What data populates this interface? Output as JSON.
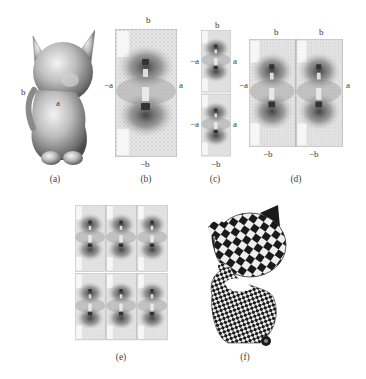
{
  "figure": {
    "panels": [
      {
        "id": "a",
        "caption": "(a)",
        "description": "3D kitten mesh, shaded",
        "seam_labels": [
          "b",
          "a"
        ]
      },
      {
        "id": "b",
        "caption": "(b)",
        "description": "parameterization cut open to a rectangle",
        "edge_labels": {
          "top": "b",
          "bottom": "−b",
          "left": "−a",
          "right": "a"
        }
      },
      {
        "id": "c",
        "caption": "(c)",
        "description": "two copies stacked vertically",
        "edge_labels": {
          "top": "b",
          "bottom": "−b",
          "left_upper": "−a",
          "right_upper": "a",
          "left_lower": "−a",
          "right_lower": "a"
        }
      },
      {
        "id": "d",
        "caption": "(d)",
        "description": "two copies side by side",
        "edge_labels": {
          "top_left": "b",
          "top_right": "b",
          "bottom_left": "−b",
          "bottom_right": "−b",
          "left": "−a",
          "right": "a"
        }
      },
      {
        "id": "e",
        "caption": "(e)",
        "description": "3×2 tiling of parameter domain"
      },
      {
        "id": "f",
        "caption": "(f)",
        "description": "kitten texture-mapped with checkerboard"
      }
    ]
  },
  "labels": {
    "a_b": "b",
    "a_a": "a",
    "b_top": "b",
    "b_bottom": "−b",
    "b_left": "−a",
    "b_right": "a",
    "c_top": "b",
    "c_bottom": "−b",
    "c_left1": "−a",
    "c_right1": "a",
    "c_left2": "−a",
    "c_right2": "a",
    "d_top1": "b",
    "d_top2": "b",
    "d_bottom1": "−b",
    "d_bottom2": "−b",
    "d_left": "−a",
    "d_right": "a"
  },
  "captions": {
    "a": "(a)",
    "b": "(b)",
    "c": "(c)",
    "d": "(d)",
    "e": "(e)",
    "f": "(f)"
  }
}
